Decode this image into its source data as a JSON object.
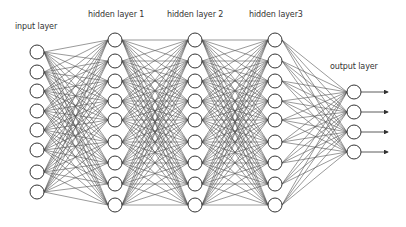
{
  "colors": {
    "edge": "#555555",
    "node_stroke": "#333333",
    "node_fill": "#ffffff",
    "text": "#333333"
  },
  "node_radius": 7,
  "layers": [
    {
      "name": "input",
      "label": "input layer",
      "x": 37,
      "nodes": [
        52,
        72,
        91,
        111,
        130,
        150,
        172,
        192
      ],
      "label_pos": [
        15,
        22
      ]
    },
    {
      "name": "hidden1",
      "label": "hidden layer 1",
      "x": 115,
      "nodes": [
        40,
        61,
        81,
        101,
        120,
        142,
        163,
        184,
        205
      ],
      "label_pos": [
        88,
        10
      ]
    },
    {
      "name": "hidden2",
      "label": "hidden layer 2",
      "x": 195,
      "nodes": [
        40,
        61,
        81,
        101,
        120,
        142,
        163,
        184,
        205
      ],
      "label_pos": [
        167,
        10
      ]
    },
    {
      "name": "hidden3",
      "label": "hidden layer3",
      "x": 275,
      "nodes": [
        40,
        61,
        81,
        101,
        120,
        142,
        163,
        184,
        205
      ],
      "label_pos": [
        249,
        10
      ]
    },
    {
      "name": "output",
      "label": "output layer",
      "x": 354,
      "nodes": [
        92,
        112,
        132,
        152
      ],
      "label_pos": [
        330,
        62
      ]
    }
  ],
  "output_arrow_end_x": 388
}
